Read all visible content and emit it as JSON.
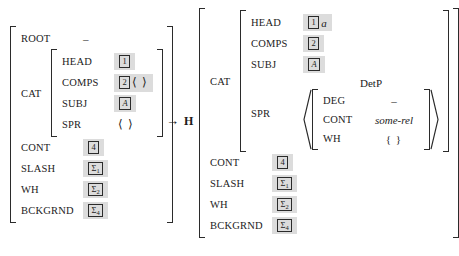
{
  "figure": {
    "type": "attribute-value-matrix-rule",
    "arrow": "→",
    "head_daughter_label": "H"
  },
  "left_matrix": {
    "rows": [
      {
        "attr": "ROOT",
        "value_kind": "dash",
        "value": "–"
      },
      {
        "attr": "CAT",
        "value_kind": "matrix",
        "rows": [
          {
            "attr": "HEAD",
            "value_kind": "tag",
            "tag": "1"
          },
          {
            "attr": "COMPS",
            "value_kind": "tag-angles",
            "tag": "2",
            "after": "⟨ ⟩"
          },
          {
            "attr": "SUBJ",
            "value_kind": "tag",
            "tag": "A",
            "italic": true
          },
          {
            "attr": "SPR",
            "value_kind": "angles",
            "value": "⟨ ⟩"
          }
        ]
      },
      {
        "attr": "CONT",
        "value_kind": "tag",
        "tag": "4"
      },
      {
        "attr": "SLASH",
        "value_kind": "tag",
        "tag": "Σ",
        "sub": "1"
      },
      {
        "attr": "WH",
        "value_kind": "tag",
        "tag": "Σ",
        "sub": "2"
      },
      {
        "attr": "BCKGRND",
        "value_kind": "tag",
        "tag": "Σ",
        "sub": "4"
      }
    ]
  },
  "right_matrix": {
    "rows": [
      {
        "attr": "CAT",
        "value_kind": "matrix",
        "rows": [
          {
            "attr": "HEAD",
            "value_kind": "tag-after",
            "tag": "1",
            "after": "a"
          },
          {
            "attr": "COMPS",
            "value_kind": "tag",
            "tag": "2"
          },
          {
            "attr": "SUBJ",
            "value_kind": "tag",
            "tag": "A",
            "italic": true
          },
          {
            "attr": "SPR",
            "value_kind": "list-matrix",
            "sort_label": "DetP",
            "rows": [
              {
                "attr": "DEG",
                "value_kind": "dash",
                "value": "–"
              },
              {
                "attr": "CONT",
                "value_kind": "italic",
                "value": "some-rel"
              },
              {
                "attr": "WH",
                "value_kind": "braces",
                "value": "{ }"
              }
            ]
          }
        ]
      },
      {
        "attr": "CONT",
        "value_kind": "tag",
        "tag": "4"
      },
      {
        "attr": "SLASH",
        "value_kind": "tag",
        "tag": "Σ",
        "sub": "1"
      },
      {
        "attr": "WH",
        "value_kind": "tag",
        "tag": "Σ",
        "sub": "2"
      },
      {
        "attr": "BCKGRND",
        "value_kind": "tag",
        "tag": "Σ",
        "sub": "4"
      }
    ]
  }
}
